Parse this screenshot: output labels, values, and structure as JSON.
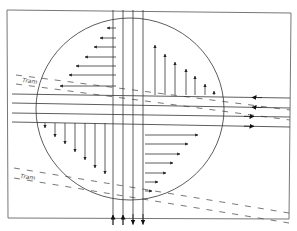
{
  "diagram": {
    "type": "intersection-traffic-flow",
    "colors": {
      "line": "#333333",
      "frame": "#777777",
      "dash": "#555555",
      "background": "#ffffff"
    },
    "labels": {
      "tram_upper": "Tram",
      "tram_lower": "Tram"
    },
    "frame": {
      "x1": 7,
      "y1": 10,
      "x2": 290,
      "y2": 219
    },
    "circle": {
      "cx": 130,
      "cy": 109,
      "rx": 94,
      "ry": 91
    },
    "vertical_road": {
      "lanes_x": [
        113,
        123,
        133,
        143
      ],
      "y_top": 10,
      "y_bottom": 225,
      "arrows": [
        "up",
        "up",
        "down",
        "down"
      ]
    },
    "horizontal_road": {
      "lanes_y_left": [
        94,
        103,
        113,
        122
      ],
      "lanes_y_right": [
        98,
        108,
        117,
        127
      ],
      "x_left": 12,
      "x_right": 290,
      "arrows": [
        "left",
        "left",
        "right",
        "right"
      ]
    },
    "quadrant_arrows": {
      "top_left_leftward": {
        "origin_x": 116,
        "rows_y": [
          28,
          38,
          47,
          57,
          66,
          75,
          86
        ],
        "tips_x": [
          107,
          100,
          94,
          85,
          76,
          69,
          60
        ]
      },
      "top_right_upward": {
        "base_y": 95,
        "cols_x": [
          155,
          165,
          175,
          186,
          195,
          205,
          214
        ],
        "tips_y": [
          45,
          54,
          62,
          69,
          76,
          84,
          91
        ]
      },
      "bottom_left_downward": {
        "origin_y": 123,
        "cols_x": [
          45,
          55,
          65,
          75,
          85,
          95,
          105
        ],
        "tips_y": [
          128,
          137,
          144,
          152,
          160,
          168,
          174
        ]
      },
      "bottom_right_rightward": {
        "origin_x": 145,
        "rows_y": [
          135,
          144,
          154,
          163,
          173,
          182,
          191
        ],
        "tips_x": [
          198,
          188,
          180,
          173,
          166,
          158,
          152
        ]
      }
    },
    "tram_tracks": [
      {
        "x1": 16,
        "y1": 75,
        "x2": 290,
        "y2": 110
      },
      {
        "x1": 16,
        "y1": 84,
        "x2": 290,
        "y2": 120
      },
      {
        "x1": 14,
        "y1": 168,
        "x2": 289,
        "y2": 213
      },
      {
        "x1": 14,
        "y1": 178,
        "x2": 289,
        "y2": 223
      }
    ]
  }
}
